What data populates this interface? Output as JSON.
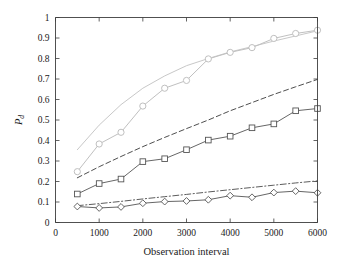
{
  "chart_data": {
    "type": "line",
    "title": "",
    "xlabel": "Observation interval",
    "ylabel": "P_d",
    "ylabel_main": "P",
    "ylabel_sub": "d",
    "xlim": [
      0,
      6000
    ],
    "ylim": [
      0,
      1
    ],
    "xticks": [
      0,
      1000,
      2000,
      3000,
      4000,
      5000,
      6000
    ],
    "xtick_labels": [
      "0",
      "1000",
      "2000",
      "3000",
      "4000",
      "5000",
      "6000"
    ],
    "yticks": [
      0,
      0.1,
      0.2,
      0.3,
      0.4,
      0.5,
      0.6,
      0.7,
      0.8,
      0.9,
      1
    ],
    "ytick_labels": [
      "0",
      "0.1",
      "0.2",
      "0.3",
      "0.4",
      "0.5",
      "0.6",
      "0.7",
      "0.8",
      "0.9",
      "1"
    ],
    "grid": false,
    "legend": "none",
    "background": "#ffffff",
    "axis_color": "#3c3c3c",
    "series": [
      {
        "name": "upper-solid-no-marker",
        "style": "solid",
        "marker": "none",
        "color": "#c8c8c8",
        "width": 1.0,
        "x": [
          500,
          1000,
          1500,
          2000,
          2500,
          3000,
          3500,
          4000,
          4500,
          5000,
          5500,
          6000
        ],
        "values": [
          0.355,
          0.475,
          0.575,
          0.655,
          0.715,
          0.765,
          0.8,
          0.832,
          0.858,
          0.885,
          0.91,
          0.935
        ]
      },
      {
        "name": "circle-marker-series",
        "style": "solid",
        "marker": "circle",
        "color": "#c0c0c0",
        "width": 1.0,
        "x": [
          500,
          1000,
          1500,
          2000,
          2500,
          3000,
          3500,
          4000,
          4500,
          5000,
          5500,
          6000
        ],
        "values": [
          0.248,
          0.383,
          0.44,
          0.568,
          0.655,
          0.693,
          0.798,
          0.83,
          0.853,
          0.898,
          0.922,
          0.938
        ]
      },
      {
        "name": "dashed-line",
        "style": "dashed",
        "marker": "none",
        "color": "#3a3a3a",
        "width": 0.9,
        "x": [
          500,
          1000,
          1500,
          2000,
          2500,
          3000,
          3500,
          4000,
          4500,
          5000,
          5500,
          6000
        ],
        "values": [
          0.218,
          0.272,
          0.322,
          0.37,
          0.415,
          0.458,
          0.5,
          0.545,
          0.585,
          0.625,
          0.662,
          0.698
        ]
      },
      {
        "name": "square-marker-series",
        "style": "solid",
        "marker": "square",
        "color": "#555555",
        "width": 0.9,
        "x": [
          500,
          1000,
          1500,
          2000,
          2500,
          3000,
          3500,
          4000,
          4500,
          5000,
          5500,
          6000
        ],
        "values": [
          0.139,
          0.19,
          0.212,
          0.297,
          0.311,
          0.355,
          0.402,
          0.421,
          0.462,
          0.481,
          0.545,
          0.556
        ]
      },
      {
        "name": "dash-dot-line",
        "style": "dashdot",
        "marker": "none",
        "color": "#4a4a4a",
        "width": 0.9,
        "x": [
          500,
          1000,
          1500,
          2000,
          2500,
          3000,
          3500,
          4000,
          4500,
          5000,
          5500,
          6000
        ],
        "values": [
          0.082,
          0.092,
          0.103,
          0.115,
          0.126,
          0.137,
          0.149,
          0.16,
          0.171,
          0.182,
          0.193,
          0.203
        ]
      },
      {
        "name": "diamond-marker-series",
        "style": "solid",
        "marker": "diamond",
        "color": "#555555",
        "width": 0.9,
        "x": [
          500,
          1000,
          1500,
          2000,
          2500,
          3000,
          3500,
          4000,
          4500,
          5000,
          5500,
          6000
        ],
        "values": [
          0.078,
          0.071,
          0.076,
          0.094,
          0.102,
          0.105,
          0.111,
          0.131,
          0.123,
          0.146,
          0.153,
          0.145
        ]
      }
    ]
  }
}
